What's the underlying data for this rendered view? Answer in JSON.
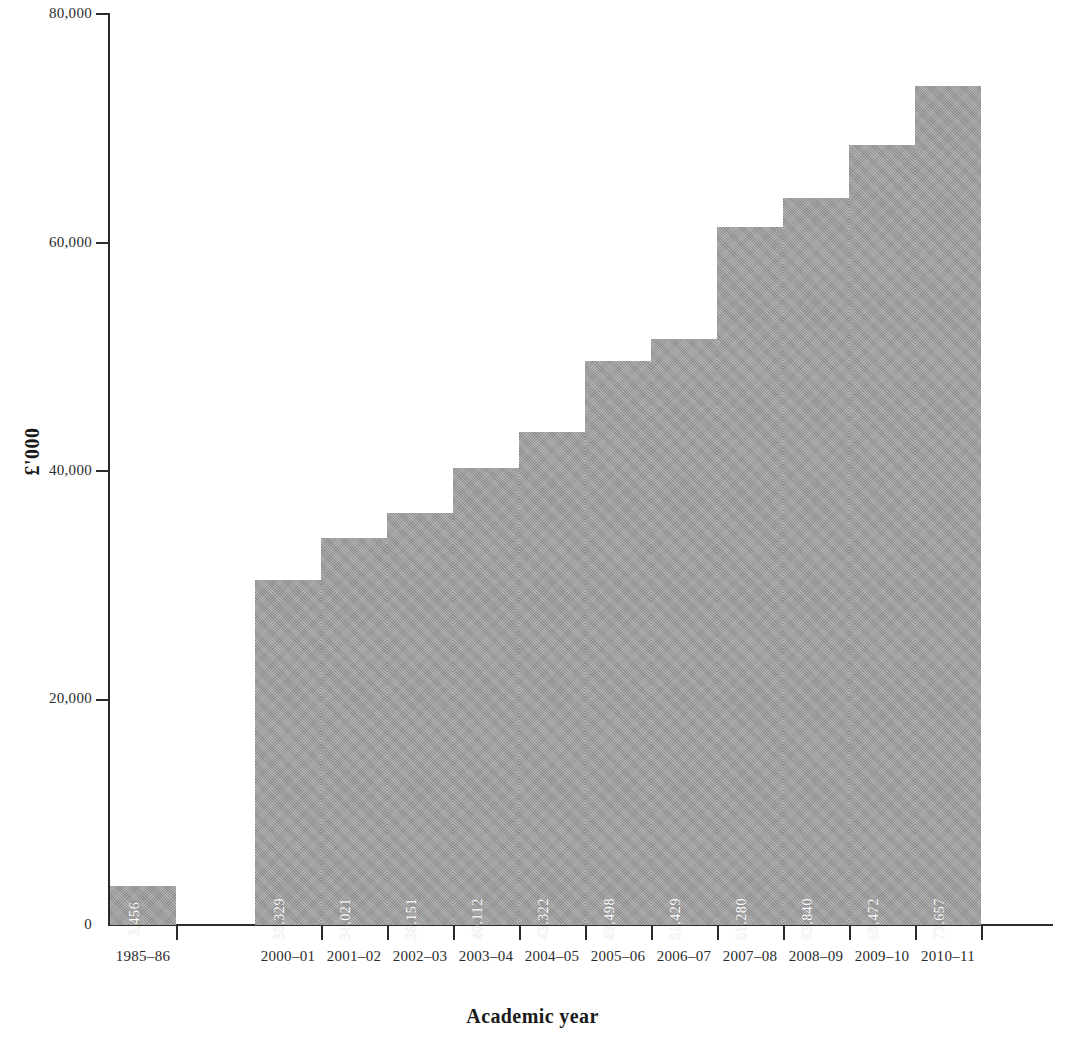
{
  "chart_data": {
    "type": "bar",
    "title": "",
    "xlabel": "Academic year",
    "ylabel": "£'000",
    "ylim": [
      0,
      80000
    ],
    "yticks": [
      0,
      20000,
      40000,
      60000,
      80000
    ],
    "ytick_labels": [
      "0",
      "20,000",
      "40,000",
      "60,000",
      "80,000"
    ],
    "grid": false,
    "legend": null,
    "categories": [
      "1985–86",
      "2000–01",
      "2001–02",
      "2002–03",
      "2003–04",
      "2004–05",
      "2005–06",
      "2006–07",
      "2007–08",
      "2008–09",
      "2009–10",
      "2010–11"
    ],
    "values": [
      3456,
      30329,
      34021,
      36151,
      40112,
      43322,
      49498,
      51429,
      61280,
      63840,
      68472,
      73657
    ],
    "value_labels": [
      "3,456",
      "30,329",
      "34,021",
      "36,151",
      "40,112",
      "43,322",
      "49,498",
      "51,429",
      "61,280",
      "63,840",
      "68,472",
      "73,657"
    ],
    "bar_color": "#9a9a9a",
    "value_label_color": "#ffffff",
    "axis_color": "#2b2b2b",
    "gap_after_first_category": true
  }
}
